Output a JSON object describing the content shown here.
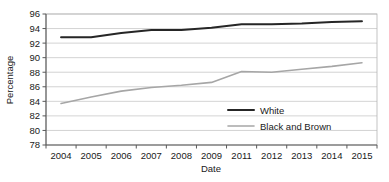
{
  "chart_data": {
    "type": "line",
    "title": "",
    "xlabel": "Date",
    "ylabel": "Percentage",
    "categories": [
      "2004",
      "2005",
      "2006",
      "2007",
      "2008",
      "2009",
      "2011",
      "2012",
      "2013",
      "2014",
      "2015"
    ],
    "series": [
      {
        "name": "White",
        "color": "#262626",
        "values": [
          92.8,
          92.8,
          93.4,
          93.8,
          93.8,
          94.1,
          94.6,
          94.6,
          94.7,
          94.9,
          95.0
        ]
      },
      {
        "name": "Black and Brown",
        "color": "#a6a6a6",
        "values": [
          83.7,
          84.6,
          85.4,
          85.9,
          86.2,
          86.6,
          88.1,
          88.0,
          88.4,
          88.8,
          89.3
        ]
      }
    ],
    "ylim": [
      78,
      96
    ],
    "ytick_step": 2,
    "yticks": [
      "78",
      "80",
      "82",
      "84",
      "86",
      "88",
      "90",
      "92",
      "94",
      "96"
    ],
    "grid": "horizontal",
    "legend_position": "inside-lower-right",
    "gridline_color": "#c8c8c8",
    "axis_color": "#595959",
    "plot_border": true
  },
  "axes": {
    "y_title": "Percentage",
    "x_title": "Date"
  },
  "legend": {
    "entries": [
      {
        "label": "White",
        "color": "#262626"
      },
      {
        "label": "Black and Brown",
        "color": "#a6a6a6"
      }
    ]
  }
}
